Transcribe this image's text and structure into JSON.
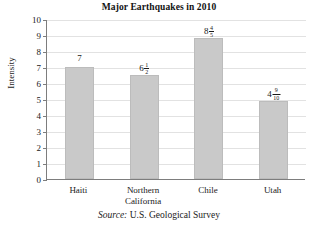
{
  "chart_data": {
    "type": "bar",
    "title": "Major Earthquakes in 2010",
    "xlabel": "",
    "ylabel": "Intensity",
    "ylim": [
      0,
      10
    ],
    "y_ticks": [
      "0",
      "1",
      "2",
      "3",
      "4",
      "5",
      "6",
      "7",
      "8",
      "9",
      "10"
    ],
    "grid": true,
    "legend": "none",
    "categories": [
      "Haiti",
      "Northern California",
      "Chile",
      "Utah"
    ],
    "values": [
      7,
      6.5,
      8.8,
      4.9
    ],
    "value_labels": [
      "7",
      "6 1/2",
      "8 4/5",
      "4 9/10"
    ],
    "bar_color": "#c9c9c9",
    "source": "Source: U.S. Geological Survey"
  },
  "title": {
    "text": "Major Earthquakes in 2010"
  },
  "axes": {
    "y_title": "Intensity",
    "y_ticks": [
      {
        "label": "10",
        "value": 10
      },
      {
        "label": "9",
        "value": 9
      },
      {
        "label": "8",
        "value": 8
      },
      {
        "label": "7",
        "value": 7
      },
      {
        "label": "6",
        "value": 6
      },
      {
        "label": "5",
        "value": 5
      },
      {
        "label": "4",
        "value": 4
      },
      {
        "label": "3",
        "value": 3
      },
      {
        "label": "2",
        "value": 2
      },
      {
        "label": "1",
        "value": 1
      },
      {
        "label": "0",
        "value": 0
      }
    ]
  },
  "bars": [
    {
      "category": "Haiti",
      "category_line1": "Haiti",
      "category_line2": "",
      "value": 7,
      "label_whole": "7",
      "label_numerator": "",
      "label_denominator": ""
    },
    {
      "category": "Northern California",
      "category_line1": "Northern",
      "category_line2": "California",
      "value": 6.5,
      "label_whole": "6",
      "label_numerator": "1",
      "label_denominator": "2"
    },
    {
      "category": "Chile",
      "category_line1": "Chile",
      "category_line2": "",
      "value": 8.8,
      "label_whole": "8",
      "label_numerator": "4",
      "label_denominator": "5"
    },
    {
      "category": "Utah",
      "category_line1": "Utah",
      "category_line2": "",
      "value": 4.9,
      "label_whole": "4",
      "label_numerator": "9",
      "label_denominator": "10"
    }
  ],
  "source": {
    "prefix": "Source:",
    "text": "U.S. Geological Survey"
  },
  "colors": {
    "bar_fill": "#c9c9c9",
    "bar_stroke": "#bcbcbc",
    "axis": "#7d7d7d",
    "grid": "#e2e2e2",
    "text": "#1a1a1a"
  }
}
